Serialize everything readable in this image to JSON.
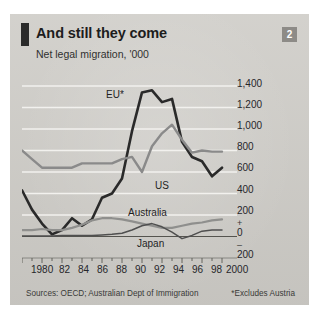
{
  "header": {
    "title": "And still they come",
    "subtitle": "Net legal migration, '000",
    "badge": "2"
  },
  "footer": {
    "sources": "Sources: OECD; Australian Dept of Immigration",
    "note": "*Excludes Austria"
  },
  "colors": {
    "background": "#cfcdc8",
    "eu_line": "#2a2a2a",
    "us_line": "#8a8a8a",
    "australia_line": "#8f8f8d",
    "japan_line": "#4f4f4f",
    "gridline": "#f2f1ee",
    "badge": "#8d8b87"
  },
  "axes": {
    "y_ticks": [
      "1,400",
      "1,200",
      "1,000",
      "800",
      "600",
      "400",
      "200",
      "0",
      "200"
    ],
    "y_sign_plus": "+",
    "y_sign_minus": "–",
    "x_ticks": [
      "1980",
      "82",
      "84",
      "86",
      "88",
      "90",
      "92",
      "94",
      "96",
      "98",
      "2000"
    ]
  },
  "chart_data": {
    "type": "line",
    "title": "And still they come",
    "subtitle": "Net legal migration, '000",
    "xlabel": "",
    "ylabel": "Net legal migration, '000",
    "ylim": [
      -200,
      1400
    ],
    "xlim": [
      1980,
      2000
    ],
    "grid": true,
    "legend": "inline-labels",
    "x": [
      1980,
      1981,
      1982,
      1983,
      1984,
      1985,
      1986,
      1987,
      1988,
      1989,
      1990,
      1991,
      1992,
      1993,
      1994,
      1995,
      1996,
      1997,
      1998,
      1999,
      2000
    ],
    "series": [
      {
        "name": "EU*",
        "label": "EU*",
        "color": "#2a2a2a",
        "values": [
          430,
          250,
          120,
          20,
          60,
          170,
          100,
          160,
          360,
          400,
          540,
          980,
          1340,
          1360,
          1250,
          1280,
          880,
          740,
          700,
          560,
          640
        ]
      },
      {
        "name": "US",
        "label": "US",
        "color": "#8a8a8a",
        "values": [
          800,
          720,
          640,
          640,
          640,
          640,
          680,
          680,
          680,
          680,
          720,
          740,
          600,
          840,
          960,
          1040,
          900,
          780,
          800,
          790,
          790
        ]
      },
      {
        "name": "Australia",
        "label": "Australia",
        "color": "#8f8f8d",
        "values": [
          60,
          60,
          70,
          60,
          60,
          80,
          110,
          150,
          170,
          170,
          160,
          140,
          120,
          100,
          80,
          80,
          100,
          120,
          130,
          150,
          160
        ]
      },
      {
        "name": "Japan",
        "label": "Japan",
        "color": "#4f4f4f",
        "values": [
          5,
          5,
          5,
          5,
          10,
          10,
          10,
          10,
          15,
          20,
          30,
          60,
          100,
          120,
          90,
          40,
          -20,
          10,
          50,
          60,
          60
        ]
      }
    ]
  },
  "series_labels": {
    "eu": "EU*",
    "us": "US",
    "australia": "Australia",
    "japan": "Japan"
  }
}
